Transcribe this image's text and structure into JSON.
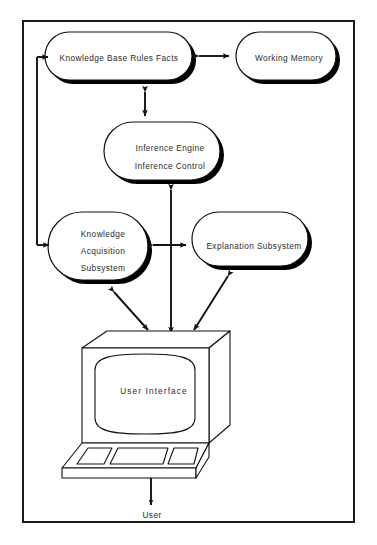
{
  "diagram": {
    "frame": {
      "stroke": "#1a1a1a",
      "background": "#ffffff"
    },
    "shadow_color": "#000000",
    "nodes": [
      {
        "id": "knowledge-base",
        "label": "Knowledge Base Rules Facts",
        "shape": "rounded-rectangle-with-shadow"
      },
      {
        "id": "working-memory",
        "label": "Working Memory",
        "shape": "rounded-rectangle-with-shadow"
      },
      {
        "id": "inference-engine",
        "label_line1": "Inference Engine",
        "label_line2": "Inference Control",
        "shape": "rounded-rectangle-with-shadow"
      },
      {
        "id": "knowledge-acquisition-subsystem",
        "label_line1": "Knowledge",
        "label_line2": "Acquisition",
        "label_line3": "Subsystem",
        "shape": "rounded-rectangle-with-shadow"
      },
      {
        "id": "explanation-subsystem",
        "label": "Explanation Subsystem",
        "shape": "rounded-rectangle-with-shadow"
      },
      {
        "id": "user-interface",
        "label": "User Interface",
        "shape": "computer-terminal-illustration"
      },
      {
        "id": "user",
        "label": "User",
        "shape": "text-only"
      }
    ],
    "connectors": [
      {
        "from": "knowledge-base",
        "to": "working-memory",
        "style": "double-arrow-horizontal"
      },
      {
        "from": "knowledge-base",
        "to": "inference-engine",
        "style": "double-arrow-vertical"
      },
      {
        "from": "knowledge-acquisition-subsystem",
        "to": "knowledge-base",
        "style": "feedback-loop-left-single-arrow"
      },
      {
        "from": "inference-engine",
        "to": "user-interface",
        "style": "double-arrow-vertical-long"
      },
      {
        "from": "knowledge-acquisition-subsystem",
        "to": "explanation-subsystem",
        "style": "double-arrow-horizontal"
      },
      {
        "from": "knowledge-acquisition-subsystem",
        "to": "user-interface",
        "style": "double-arrow-diagonal"
      },
      {
        "from": "explanation-subsystem",
        "to": "user-interface",
        "style": "double-arrow-diagonal"
      },
      {
        "from": "user-interface",
        "to": "user",
        "style": "double-arrow-vertical-short"
      }
    ]
  }
}
